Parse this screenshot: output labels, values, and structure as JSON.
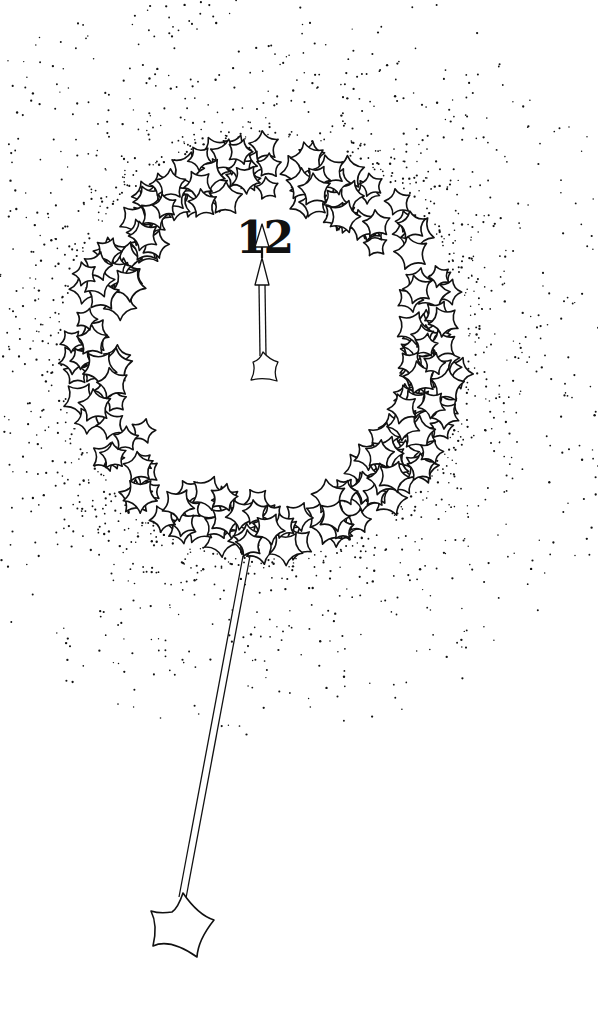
{
  "illustration": {
    "subject": "star-wreath clock with pendulum wand",
    "ink_color": "#111111",
    "paper_color": "#ffffff",
    "clock": {
      "numeral": "12",
      "center": [
        265,
        348
      ],
      "wreath_inner_radius": [
        138,
        142
      ],
      "wreath_outer_radius": [
        205,
        212
      ]
    },
    "hand": {
      "pointing_to": "12",
      "tip": [
        262,
        228
      ],
      "base_star": [
        265,
        368
      ]
    },
    "pendulum": {
      "top": [
        246,
        555
      ],
      "bottom": [
        184,
        895
      ],
      "star_center": [
        180,
        925
      ]
    }
  }
}
